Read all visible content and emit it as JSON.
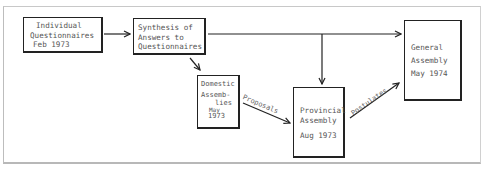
{
  "diagram": {
    "nodes": [
      {
        "id": "individual",
        "lines": [
          "Individual",
          "Questionnaires",
          "Feb 1973"
        ]
      },
      {
        "id": "synthesis",
        "lines": [
          "Synthesis of",
          "Answers to",
          "Questionnaires"
        ]
      },
      {
        "id": "domestic",
        "lines": [
          "Domestic",
          "Assemb-",
          "lies",
          "May",
          "1973"
        ]
      },
      {
        "id": "provincial",
        "lines": [
          "Provincial",
          "Assembly",
          "",
          "Aug 1973"
        ]
      },
      {
        "id": "general",
        "lines": [
          "General",
          "Assembly",
          "",
          "May 1974"
        ]
      }
    ],
    "edges": [
      {
        "from": "individual",
        "to": "synthesis",
        "label": ""
      },
      {
        "from": "synthesis",
        "to": "general",
        "label": ""
      },
      {
        "from": "synthesis",
        "to": "provincial",
        "label": ""
      },
      {
        "from": "synthesis",
        "to": "domestic",
        "label": ""
      },
      {
        "from": "domestic",
        "to": "provincial",
        "label": "Proposals"
      },
      {
        "from": "provincial",
        "to": "general",
        "label": "Postulates"
      }
    ]
  }
}
